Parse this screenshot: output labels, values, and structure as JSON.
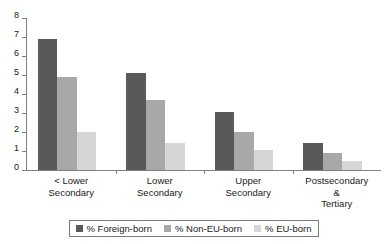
{
  "chart_data": {
    "type": "bar",
    "title": "",
    "subtitle": "",
    "xlabel": "",
    "ylabel": "",
    "ylim": [
      0,
      8
    ],
    "ytick_step": 1,
    "yticks": [
      "8",
      "7",
      "6",
      "5",
      "4",
      "3",
      "2",
      "1",
      "0"
    ],
    "grid": false,
    "legend_position": "bottom",
    "categories": [
      "< Lower\nSecondary",
      "Lower\nSecondary",
      "Upper\nSecondary",
      "Postsecondary\n&\nTertiary"
    ],
    "series": [
      {
        "name": "% Foreign-born",
        "color": "#595959",
        "values": [
          6.9,
          5.1,
          3.05,
          1.4
        ]
      },
      {
        "name": "% Non-EU-born",
        "color": "#a8a8a8",
        "values": [
          4.9,
          3.7,
          2.0,
          0.9
        ]
      },
      {
        "name": "% EU-born",
        "color": "#d6d6d6",
        "values": [
          2.0,
          1.4,
          1.05,
          0.5
        ]
      }
    ]
  },
  "legend": {
    "items": [
      {
        "label": "% Foreign-born"
      },
      {
        "label": "% Non-EU-born"
      },
      {
        "label": "% EU-born"
      }
    ]
  },
  "axes": {
    "y": {
      "labels": [
        "8",
        "7",
        "6",
        "5",
        "4",
        "3",
        "2",
        "1",
        "0"
      ]
    },
    "x": {
      "labels": [
        "< Lower\nSecondary",
        "Lower\nSecondary",
        "Upper\nSecondary",
        "Postsecondary\n&\nTertiary"
      ]
    }
  }
}
